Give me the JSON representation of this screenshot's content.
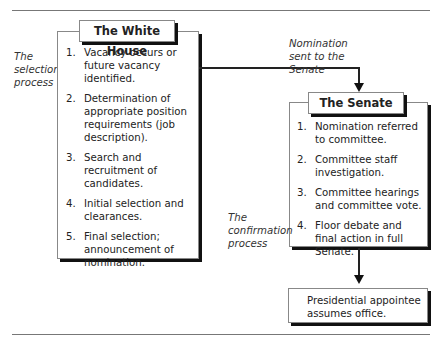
{
  "diagram": {
    "labels": {
      "selection_process": "The selection process",
      "confirmation_process": "The confirmation process",
      "nomination_sent": "Nomination sent to the Senate"
    },
    "white_house": {
      "title": "The White House",
      "steps": [
        {
          "num": "1.",
          "text": "Vacancy occurs or future vacancy identified."
        },
        {
          "num": "2.",
          "text": "Determination of appropriate position requirements (job description)."
        },
        {
          "num": "3.",
          "text": "Search and recruitment of candidates."
        },
        {
          "num": "4.",
          "text": "Initial selection and clearances."
        },
        {
          "num": "5.",
          "text": "Final selection; announcement of nomination."
        }
      ]
    },
    "senate": {
      "title": "The Senate",
      "steps": [
        {
          "num": "1.",
          "text": "Nomination referred to committee."
        },
        {
          "num": "2.",
          "text": "Committee staff investigation."
        },
        {
          "num": "3.",
          "text": "Committee hearings and committee vote."
        },
        {
          "num": "4.",
          "text": "Floor debate and final action in full Senate."
        }
      ]
    },
    "outcome": {
      "text": "Presidential appointee assumes office."
    }
  }
}
